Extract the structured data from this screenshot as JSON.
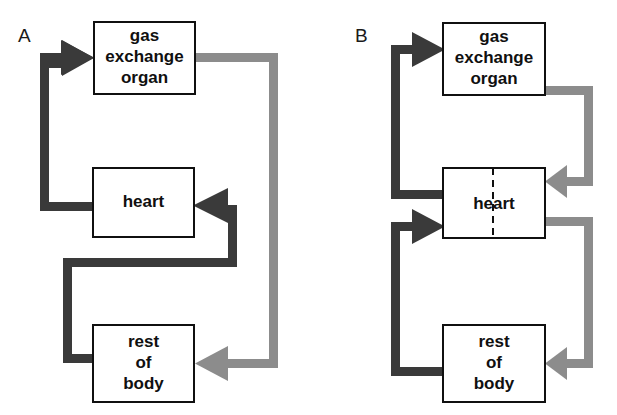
{
  "figure": {
    "type": "diagram",
    "width": 617,
    "height": 415,
    "background": "#ffffff"
  },
  "colors": {
    "deoxygenated_flow": "#3a3a3a",
    "oxygenated_flow": "#8c8c8c",
    "box_stroke": "#101010",
    "box_fill": "#ffffff",
    "text": "#101010"
  },
  "panels": [
    {
      "id": "A",
      "label": "A",
      "description": "single circulation",
      "boxes": [
        {
          "id": "gas-exchange-organ",
          "lines": [
            "gas",
            "exchange",
            "organ"
          ]
        },
        {
          "id": "heart",
          "lines": [
            "heart"
          ]
        },
        {
          "id": "rest-of-body",
          "lines": [
            "rest",
            "of",
            "body"
          ]
        }
      ],
      "divided_heart": false,
      "flows": [
        {
          "id": "heart-to-gas-exchange-organ",
          "from": "heart",
          "to": "gas-exchange-organ",
          "color": "deoxygenated_flow"
        },
        {
          "id": "gas-exchange-organ-to-rest-of-body",
          "from": "gas-exchange-organ",
          "to": "rest-of-body",
          "color": "oxygenated_flow"
        },
        {
          "id": "rest-of-body-to-heart",
          "from": "rest-of-body",
          "to": "heart",
          "color": "deoxygenated_flow"
        }
      ]
    },
    {
      "id": "B",
      "label": "B",
      "description": "double circulation",
      "boxes": [
        {
          "id": "gas-exchange-organ",
          "lines": [
            "gas",
            "exchange",
            "organ"
          ]
        },
        {
          "id": "heart",
          "lines": [
            "heart"
          ]
        },
        {
          "id": "rest-of-body",
          "lines": [
            "rest",
            "of",
            "body"
          ]
        }
      ],
      "divided_heart": true,
      "flows": [
        {
          "id": "heart-to-gas-exchange-organ",
          "from": "heart",
          "to": "gas-exchange-organ",
          "color": "deoxygenated_flow"
        },
        {
          "id": "gas-exchange-organ-to-heart",
          "from": "gas-exchange-organ",
          "to": "heart",
          "color": "oxygenated_flow"
        },
        {
          "id": "heart-to-rest-of-body",
          "from": "heart",
          "to": "rest-of-body",
          "color": "oxygenated_flow"
        },
        {
          "id": "rest-of-body-to-heart",
          "from": "rest-of-body",
          "to": "heart",
          "color": "deoxygenated_flow"
        }
      ]
    }
  ]
}
